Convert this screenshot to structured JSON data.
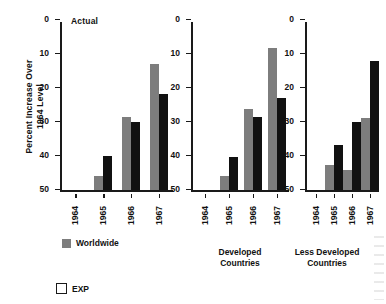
{
  "chart_data": {
    "type": "bar",
    "title": "",
    "annotation": "Actual",
    "ylabel": "Percent Increase Over\n1964 Level",
    "xlabel": "",
    "ylim": [
      0,
      50
    ],
    "yticks": [
      0,
      10,
      20,
      30,
      40,
      50
    ],
    "grid": false,
    "legend_position": "bottom-left",
    "categories": [
      "1964",
      "1965",
      "1966",
      "1967"
    ],
    "legend": [
      {
        "label": "Worldwide",
        "color": "#7d7d7d"
      },
      {
        "label": "EXP",
        "color": "#ffffff"
      }
    ],
    "panels": [
      {
        "name": "Worldwide",
        "caption": "",
        "categories": [
          "1964",
          "1965",
          "1966",
          "1967"
        ],
        "series": [
          {
            "name": "Worldwide",
            "color": "#7d7d7d",
            "values": [
              0,
              4.3,
              21.5,
              37.2
            ]
          },
          {
            "name": "EXP",
            "color": "#111111",
            "values": [
              0,
              10.0,
              20.0,
              28.5
            ]
          }
        ]
      },
      {
        "name": "Developed Countries",
        "caption": "Developed\nCountries",
        "categories": [
          "1964",
          "1965",
          "1966",
          "1967"
        ],
        "series": [
          {
            "name": "Worldwide",
            "color": "#7d7d7d",
            "values": [
              0,
              4.1,
              24.0,
              42.0
            ]
          },
          {
            "name": "EXP",
            "color": "#111111",
            "values": [
              0,
              9.7,
              21.7,
              27.3
            ]
          }
        ]
      },
      {
        "name": "Less Developed Countries",
        "caption": "Less Developed\nCountries",
        "categories": [
          "1964",
          "1965",
          "1966",
          "1967"
        ],
        "series": [
          {
            "name": "Worldwide",
            "color": "#7d7d7d",
            "values": [
              0,
              7.5,
              6.0,
              21.3
            ]
          },
          {
            "name": "EXP",
            "color": "#111111",
            "values": [
              0,
              13.5,
              20.2,
              38.2
            ]
          }
        ]
      }
    ]
  },
  "axis": {
    "ytitle": "Percent Increase Over\n1964 Level",
    "ticks": [
      "50",
      "40",
      "30",
      "20",
      "10",
      "0"
    ]
  },
  "panels": {
    "p0": {
      "caption": ""
    },
    "p1": {
      "caption": "Developed\nCountries"
    },
    "p2": {
      "caption": "Less Developed\nCountries"
    }
  },
  "annotations": {
    "actual": "Actual"
  },
  "legend": {
    "worldwide": "Worldwide",
    "exp": "EXP"
  }
}
